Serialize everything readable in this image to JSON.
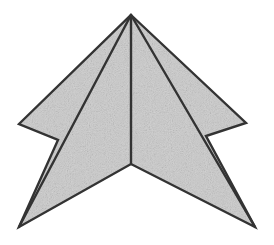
{
  "figure": {
    "title": "Shaded arrowhead polygon with internal fold lines",
    "background_color": "#FFFFFF",
    "fill_color": "#CCCCCC",
    "fill_texture": "speckled-noise",
    "stroke_color": "#333333",
    "stroke_width": 2.4,
    "canvas": {
      "width": 274,
      "height": 245
    },
    "outline_points": [
      {
        "name": "apex-top",
        "x": 131,
        "y": 15
      },
      {
        "name": "right-upper-wing-tip",
        "x": 246,
        "y": 123
      },
      {
        "name": "right-notch-inner",
        "x": 206,
        "y": 136
      },
      {
        "name": "bottom-right-tip",
        "x": 255,
        "y": 227
      },
      {
        "name": "bottom-center-notch",
        "x": 131,
        "y": 164
      },
      {
        "name": "bottom-left-tip",
        "x": 19,
        "y": 227
      },
      {
        "name": "left-notch-inner",
        "x": 58,
        "y": 140
      },
      {
        "name": "left-upper-wing-tip",
        "x": 19,
        "y": 124
      }
    ],
    "outline_path": "M131,15 L246,123 L206,136 L255,227 L131,164 L19,227 L58,140 L19,124 Z",
    "fold_lines": [
      {
        "name": "left-fold-line",
        "from": {
          "x": 131,
          "y": 15
        },
        "to": {
          "x": 19,
          "y": 227
        },
        "path": "M131,15 L19,227"
      },
      {
        "name": "center-fold-line",
        "from": {
          "x": 131,
          "y": 15
        },
        "to": {
          "x": 131,
          "y": 164
        },
        "path": "M131,15 L131,164"
      },
      {
        "name": "right-fold-line",
        "from": {
          "x": 131,
          "y": 15
        },
        "to": {
          "x": 255,
          "y": 227
        },
        "path": "M131,15 L255,227"
      }
    ],
    "facets": [
      {
        "name": "left-wing-facet",
        "path": "M131,15 L19,124 L58,140 L19,227 Z"
      },
      {
        "name": "left-inner-facet",
        "path": "M131,15 L19,227 L131,164 Z"
      },
      {
        "name": "right-inner-facet",
        "path": "M131,15 L131,164 L255,227 Z"
      },
      {
        "name": "right-wing-facet",
        "path": "M131,15 L255,227 L206,136 L246,123 Z"
      }
    ]
  }
}
